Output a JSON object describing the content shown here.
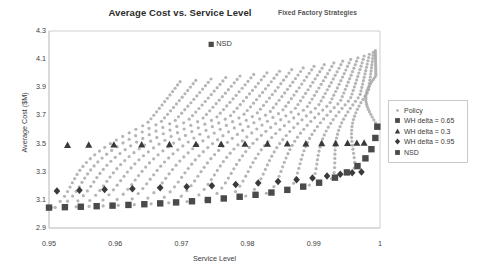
{
  "chart_data": {
    "type": "scatter",
    "title": "Average Cost vs. Service Level",
    "subtitle": "Fixed Factory Strategies",
    "xlabel": "Service Level",
    "ylabel": "Average Cost ($M)",
    "xlim": [
      0.95,
      1.0
    ],
    "ylim": [
      2.9,
      4.3
    ],
    "xticks": [
      "0.95",
      "0.96",
      "0.97",
      "0.98",
      "0.99",
      "1"
    ],
    "xtick_values": [
      0.95,
      0.96,
      0.97,
      0.98,
      0.99,
      1.0
    ],
    "yticks": [
      "2.9",
      "3.1",
      "3.3",
      "3.5",
      "3.7",
      "3.9",
      "4.1",
      "4.3"
    ],
    "ytick_values": [
      2.9,
      3.1,
      3.3,
      3.5,
      3.7,
      3.9,
      4.1,
      4.3
    ],
    "grid": false,
    "legend_position": "right",
    "annotations": [
      {
        "label": "NSD",
        "x": 0.9745,
        "y": 4.205,
        "marker": "dot"
      }
    ],
    "series": [
      {
        "name": "Policy",
        "marker": "dot",
        "color": "#a8a8a8",
        "size": 1.6,
        "description": "Dense family of 20 hook-shaped (J-shaped) policy curves; each curve rises from the lower-left envelope, bends left then sweeps up-right toward service level 1.0",
        "curve_count": 20,
        "points_per_curve": 34
      },
      {
        "name": "WH delta = 0.65",
        "marker": "square",
        "color": "#4a4a4a",
        "size": 3.2,
        "description": "Dark square markers tracing the lower efficient-frontier envelope from (0.950, 3.045) rising to (0.9995, 3.62)",
        "points": [
          {
            "x": 0.95,
            "y": 3.045
          },
          {
            "x": 0.9524,
            "y": 3.048
          },
          {
            "x": 0.9548,
            "y": 3.051
          },
          {
            "x": 0.9572,
            "y": 3.055
          },
          {
            "x": 0.9596,
            "y": 3.059
          },
          {
            "x": 0.962,
            "y": 3.064
          },
          {
            "x": 0.9644,
            "y": 3.069
          },
          {
            "x": 0.9668,
            "y": 3.075
          },
          {
            "x": 0.9692,
            "y": 3.082
          },
          {
            "x": 0.9716,
            "y": 3.09
          },
          {
            "x": 0.974,
            "y": 3.099
          },
          {
            "x": 0.9764,
            "y": 3.11
          },
          {
            "x": 0.9788,
            "y": 3.122
          },
          {
            "x": 0.9812,
            "y": 3.136
          },
          {
            "x": 0.9836,
            "y": 3.152
          },
          {
            "x": 0.986,
            "y": 3.171
          },
          {
            "x": 0.9884,
            "y": 3.194
          },
          {
            "x": 0.9908,
            "y": 3.222
          },
          {
            "x": 0.9932,
            "y": 3.258
          },
          {
            "x": 0.995,
            "y": 3.295
          },
          {
            "x": 0.9966,
            "y": 3.34
          },
          {
            "x": 0.9978,
            "y": 3.395
          },
          {
            "x": 0.9987,
            "y": 3.46
          },
          {
            "x": 0.9993,
            "y": 3.54
          },
          {
            "x": 0.9996,
            "y": 3.62
          }
        ]
      },
      {
        "name": "WH delta = 0.3",
        "marker": "triangle",
        "color": "#3a3a3a",
        "size": 3.2,
        "description": "Dark triangular markers at the mid-upper knee of each policy hook, forming an arc from (0.9528, 3.49) to (0.9975, 3.50)",
        "points": [
          {
            "x": 0.9528,
            "y": 3.487
          },
          {
            "x": 0.956,
            "y": 3.489
          },
          {
            "x": 0.9598,
            "y": 3.49
          },
          {
            "x": 0.964,
            "y": 3.491
          },
          {
            "x": 0.9682,
            "y": 3.492
          },
          {
            "x": 0.9722,
            "y": 3.493
          },
          {
            "x": 0.976,
            "y": 3.494
          },
          {
            "x": 0.9796,
            "y": 3.495
          },
          {
            "x": 0.983,
            "y": 3.496
          },
          {
            "x": 0.986,
            "y": 3.497
          },
          {
            "x": 0.9888,
            "y": 3.498
          },
          {
            "x": 0.9912,
            "y": 3.499
          },
          {
            "x": 0.9933,
            "y": 3.5
          },
          {
            "x": 0.9951,
            "y": 3.501
          },
          {
            "x": 0.9965,
            "y": 3.502
          },
          {
            "x": 0.9976,
            "y": 3.503
          }
        ]
      },
      {
        "name": "WH delta = 0.95",
        "marker": "diamond",
        "color": "#3a3a3a",
        "size": 3.0,
        "description": "Dark diamond markers low on each policy hook, forming an arc from (0.9512, 3.165) to (0.9988, 3.30)",
        "points": [
          {
            "x": 0.9512,
            "y": 3.163
          },
          {
            "x": 0.9546,
            "y": 3.168
          },
          {
            "x": 0.9584,
            "y": 3.173
          },
          {
            "x": 0.9626,
            "y": 3.179
          },
          {
            "x": 0.9668,
            "y": 3.186
          },
          {
            "x": 0.9708,
            "y": 3.193
          },
          {
            "x": 0.9746,
            "y": 3.201
          },
          {
            "x": 0.9782,
            "y": 3.21
          },
          {
            "x": 0.9816,
            "y": 3.22
          },
          {
            "x": 0.9846,
            "y": 3.231
          },
          {
            "x": 0.9874,
            "y": 3.243
          },
          {
            "x": 0.9898,
            "y": 3.256
          },
          {
            "x": 0.992,
            "y": 3.269
          },
          {
            "x": 0.994,
            "y": 3.282
          },
          {
            "x": 0.9958,
            "y": 3.292
          },
          {
            "x": 0.9972,
            "y": 3.298
          }
        ]
      },
      {
        "name": "NSD",
        "marker": "square",
        "color": "#4a4a4a",
        "size": 2.6,
        "description": "Single no-stock-decision reference point annotated in the upper plot area",
        "points": [
          {
            "x": 0.9745,
            "y": 4.205
          }
        ]
      }
    ],
    "legend": [
      {
        "label": "Policy",
        "marker": "dot",
        "color": "#a8a8a8"
      },
      {
        "label": "WH delta = 0.65",
        "marker": "square",
        "color": "#4a4a4a"
      },
      {
        "label": "WH delta = 0.3",
        "marker": "triangle",
        "color": "#3a3a3a"
      },
      {
        "label": "WH delta = 0.95",
        "marker": "diamond",
        "color": "#3a3a3a"
      },
      {
        "label": "NSD",
        "marker": "square",
        "color": "#4a4a4a"
      }
    ]
  }
}
